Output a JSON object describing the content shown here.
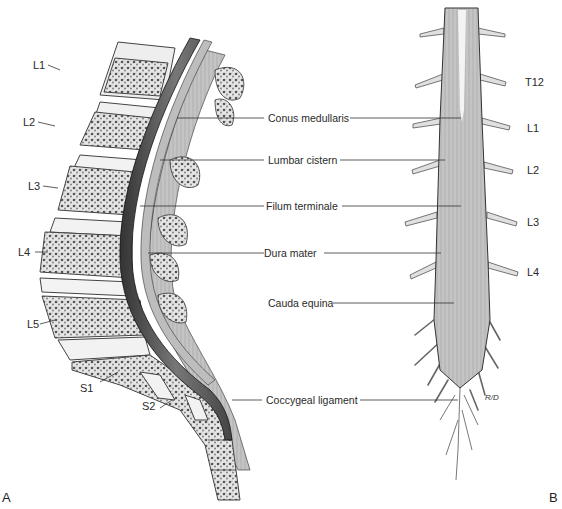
{
  "figure": {
    "panel_a": {
      "letter": "A",
      "vertebra_labels": [
        "L1",
        "L2",
        "L3",
        "L4",
        "L5",
        "S1",
        "S2"
      ]
    },
    "panel_b": {
      "letter": "B",
      "level_labels": [
        "T12",
        "L1",
        "L2",
        "L3",
        "L4"
      ]
    },
    "center_labels": [
      "Conus medullaris",
      "Lumbar cistern",
      "Filum terminale",
      "Dura mater",
      "Cauda equina",
      "Coccygeal ligament"
    ],
    "artist_signature": "R/D"
  }
}
